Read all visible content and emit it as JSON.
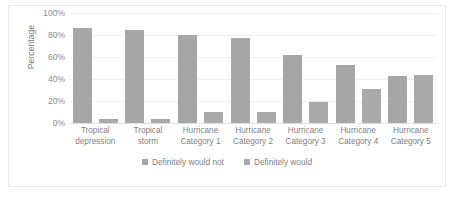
{
  "chart_data": {
    "type": "bar",
    "title": "",
    "subtitle": "",
    "xlabel": "",
    "ylabel": "Percentage",
    "ylim": [
      0,
      100
    ],
    "yticks": [
      "0%",
      "20%",
      "40%",
      "60%",
      "80%",
      "100%"
    ],
    "ytick_values": [
      0,
      20,
      40,
      60,
      80,
      100
    ],
    "grid": true,
    "legend_position": "bottom",
    "categories": [
      "Tropical\ndepression",
      "Tropical\nstorm",
      "Hurricane\nCategory 1",
      "Hurricane\nCategory 2",
      "Hurricane\nCategory 3",
      "Hurricane\nCategory 4",
      "Hurricane\nCategory 5"
    ],
    "series": [
      {
        "name": "Definitely would not",
        "color": "#a6a6a6",
        "values": [
          86,
          85,
          80,
          77,
          62,
          53,
          43
        ]
      },
      {
        "name": "Definitely would",
        "color": "#a9a9a9",
        "values": [
          4,
          4,
          10,
          10,
          19,
          31,
          44
        ]
      }
    ]
  }
}
